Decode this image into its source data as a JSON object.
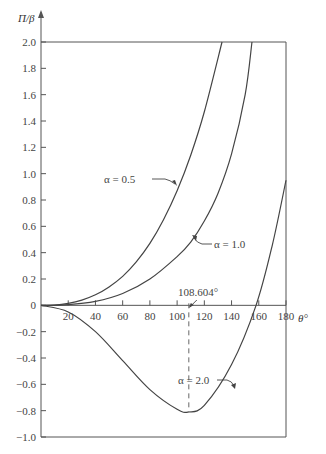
{
  "chart_data": {
    "type": "line",
    "title": "",
    "xlabel": "θ°",
    "ylabel": "Π/β",
    "xlim": [
      0,
      180
    ],
    "ylim": [
      -1.0,
      2.0
    ],
    "grid": false,
    "legend_position": "inline-annotations",
    "x_ticks": [
      20,
      40,
      60,
      80,
      100,
      120,
      140,
      160,
      180
    ],
    "y_ticks": [
      2.0,
      1.8,
      1.6,
      1.4,
      1.2,
      1.0,
      0.8,
      0.6,
      0.4,
      0.2,
      0,
      -0.2,
      -0.4,
      -0.6,
      -0.8,
      -1.0
    ],
    "y_tick_labels": [
      "2.0",
      "1.8",
      "1.6",
      "1.4",
      "1.2",
      "1.0",
      "0.8",
      "0.6",
      "0.4",
      "0.2",
      "0",
      "−0.2",
      "−0.4",
      "−0.6",
      "−0.8",
      "−1.0"
    ],
    "x_tick_labels": [
      "20",
      "40",
      "60",
      "80",
      "100",
      "120",
      "140",
      "160",
      "180"
    ],
    "series": [
      {
        "name": "α = 0.5",
        "x": [
          0,
          10,
          20,
          30,
          40,
          50,
          60,
          70,
          80,
          90,
          100,
          110,
          120,
          133
        ],
        "values": [
          0,
          0.002,
          0.015,
          0.04,
          0.08,
          0.14,
          0.22,
          0.33,
          0.47,
          0.65,
          0.87,
          1.14,
          1.47,
          2.0
        ]
      },
      {
        "name": "α = 1.0",
        "x": [
          0,
          20,
          40,
          60,
          80,
          100,
          110,
          120,
          130,
          140,
          150,
          155
        ],
        "values": [
          0,
          0.005,
          0.03,
          0.09,
          0.2,
          0.37,
          0.48,
          0.64,
          0.85,
          1.15,
          1.6,
          2.0
        ]
      },
      {
        "name": "α = 2.0",
        "x": [
          0,
          20,
          40,
          60,
          80,
          100,
          108.604,
          120,
          140,
          158,
          170,
          180
        ],
        "values": [
          0,
          -0.05,
          -0.2,
          -0.42,
          -0.64,
          -0.79,
          -0.81,
          -0.76,
          -0.45,
          0,
          0.46,
          0.95
        ]
      }
    ],
    "annotations": [
      {
        "text": "α = 0.5",
        "points_to": "α = 0.5 curve"
      },
      {
        "text": "α = 1.0",
        "points_to": "α = 1.0 curve"
      },
      {
        "text": "α = 2.0",
        "points_to": "α = 2.0 curve"
      },
      {
        "text": "108.604°",
        "points_to": "minimum of α = 2.0 curve",
        "x": 108.604
      }
    ]
  },
  "labels": {
    "ylabel": "Π/β",
    "xlabel": "θ°",
    "alpha_05": "α = 0.5",
    "alpha_10": "α = 1.0",
    "alpha_20": "α = 2.0",
    "min_angle": "108.604°"
  }
}
